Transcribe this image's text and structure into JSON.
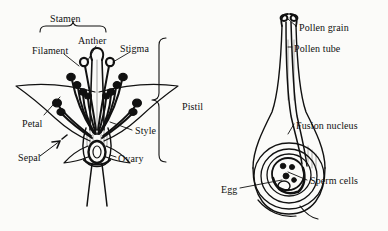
{
  "figure": {
    "background_color": "#fbfbf9",
    "ink_color": "#111111",
    "style": "black-and-white botanical line drawing"
  },
  "panels": [
    {
      "id": "flower-cross-section",
      "title": "Flower longitudinal section",
      "labels": [
        {
          "key": "stamen",
          "text": "Stamen",
          "x": 50,
          "y": 14,
          "connector": "brace-down"
        },
        {
          "key": "anther",
          "text": "Anther",
          "x": 78,
          "y": 36,
          "connector": "leader-down-left"
        },
        {
          "key": "filament",
          "text": "Filament",
          "x": 32,
          "y": 46,
          "connector": "leader-down-right"
        },
        {
          "key": "stigma",
          "text": "Stigma",
          "x": 120,
          "y": 44,
          "connector": "leader-down-left"
        },
        {
          "key": "petal",
          "text": "Petal",
          "x": 22,
          "y": 119,
          "connector": "leader-up-right"
        },
        {
          "key": "sepal",
          "text": "Sepal",
          "x": 18,
          "y": 153,
          "connector": "arrow-up-right"
        },
        {
          "key": "style",
          "text": "Style",
          "x": 135,
          "y": 126,
          "connector": "leader-left"
        },
        {
          "key": "ovary",
          "text": "Ovary",
          "x": 118,
          "y": 154,
          "connector": "leader-left"
        },
        {
          "key": "pistil",
          "text": "Pistil",
          "x": 182,
          "y": 102,
          "connector": "brace-left-tall"
        }
      ],
      "parts": [
        "petals",
        "sepals",
        "stamens with filaments and anthers",
        "pistil with stigma, style and ovary",
        "pedicel"
      ]
    },
    {
      "id": "pistil-fertilization-detail",
      "title": "Pistil with pollen tube and ovule",
      "labels": [
        {
          "key": "pollen-grain",
          "text": "Pollen grain",
          "x": 299,
          "y": 23,
          "connector": "leader-up-left"
        },
        {
          "key": "pollen-tube",
          "text": "Pollen tube",
          "x": 294,
          "y": 44,
          "connector": "leader-left"
        },
        {
          "key": "fusion-nucleus",
          "text": "Fusion nucleus",
          "x": 296,
          "y": 121,
          "connector": "leader-down-left"
        },
        {
          "key": "sperm-cells",
          "text": "Sperm cells",
          "x": 310,
          "y": 176,
          "connector": "leader-left"
        },
        {
          "key": "egg",
          "text": "Egg",
          "x": 221,
          "y": 185,
          "connector": "leader-right"
        }
      ],
      "parts": [
        "stigma",
        "style",
        "pollen tubes",
        "ovary wall",
        "ovule integuments",
        "embryo sac",
        "egg cell",
        "sperm cells",
        "fusion nucleus"
      ]
    }
  ]
}
